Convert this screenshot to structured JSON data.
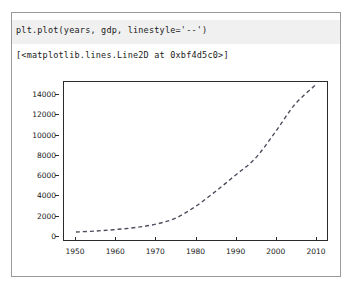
{
  "cell": {
    "input_code": "plt.plot(years, gdp, linestyle='--')",
    "output_repr": "[<matplotlib.lines.Line2D at 0xbf4d5c0>]"
  },
  "colors": {
    "input_band_background": "#f0f0f0",
    "cell_border": "#9a9a9a",
    "axes_spine": "#2b2b2b",
    "line_color": "#4c4c5c",
    "text": "#1a1a1a",
    "figure_background": "#ffffff"
  },
  "chart_data": {
    "type": "line",
    "title": "",
    "xlabel": "",
    "ylabel": "",
    "xlim": [
      1947,
      2013
    ],
    "ylim": [
      -500,
      15300
    ],
    "grid": false,
    "legend": null,
    "linestyle": "--",
    "xticks": [
      1950,
      1960,
      1970,
      1980,
      1990,
      2000,
      2010
    ],
    "yticks": [
      0,
      2000,
      4000,
      6000,
      8000,
      10000,
      12000,
      14000
    ],
    "series": [
      {
        "name": "gdp",
        "x": [
          1950,
          1955,
          1960,
          1965,
          1970,
          1975,
          1980,
          1985,
          1990,
          1995,
          2000,
          2005,
          2010
        ],
        "y": [
          300,
          400,
          550,
          750,
          1080,
          1690,
          2860,
          4350,
          5980,
          7660,
          10290,
          13090,
          14960
        ]
      }
    ]
  }
}
